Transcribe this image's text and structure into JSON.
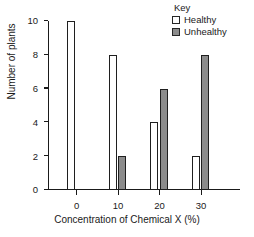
{
  "chart_data": {
    "type": "bar",
    "title": "",
    "xlabel": "Concentration of Chemical X (%)",
    "ylabel": "Number of plants",
    "categories": [
      "0",
      "10",
      "20",
      "30"
    ],
    "series": [
      {
        "name": "Healthy",
        "values": [
          10,
          8,
          4,
          2
        ],
        "color": "#ffffff",
        "swatch": "hollow"
      },
      {
        "name": "Unhealthy",
        "values": [
          0,
          2,
          6,
          8
        ],
        "color": "#8c8c8c",
        "swatch": "filled"
      }
    ],
    "ylim": [
      0,
      10
    ],
    "ytick_labels": [
      "0",
      "2",
      "4",
      "6",
      "8",
      "10"
    ],
    "ytick_values": [
      0,
      2,
      4,
      6,
      8,
      10
    ],
    "grid": false,
    "legend_position": "top-right",
    "legend_title": "Key"
  },
  "legend": {
    "title": "Key",
    "entries": [
      {
        "label": "Healthy"
      },
      {
        "label": "Unhealthy"
      }
    ]
  },
  "axes": {
    "x_title": "Concentration of Chemical X (%)",
    "y_title": "Number of plants"
  }
}
